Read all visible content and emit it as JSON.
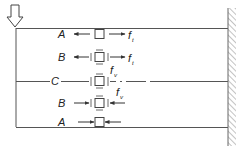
{
  "diagram": {
    "type": "stress-element-diagram",
    "load_arrow": "down-arrow-icon",
    "colors": {
      "line": "#555555",
      "text": "#222222",
      "hatch": "#888888",
      "background": "#ffffff"
    },
    "rows": [
      {
        "label": "A",
        "force_label": "f",
        "force_sub": "t",
        "stress": "tension"
      },
      {
        "label": "B",
        "force_label": "f",
        "force_sub": "t",
        "stress": "tension-shear"
      },
      {
        "label": "C",
        "force_label": "f",
        "force_sub": "v",
        "stress": "pure-shear"
      },
      {
        "label": "B",
        "force_label": "f",
        "force_sub": "v",
        "stress": "compression-shear"
      },
      {
        "label": "A",
        "force_label": "",
        "force_sub": "",
        "stress": "compression"
      }
    ]
  }
}
